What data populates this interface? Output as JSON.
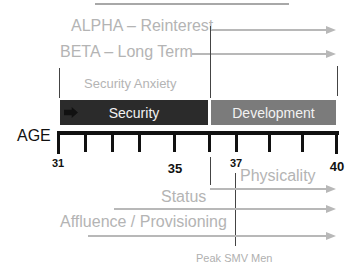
{
  "diagram": {
    "axis": {
      "label": "AGE",
      "ticks": [
        {
          "value": "31",
          "x": 58,
          "label_y": 157
        },
        {
          "value": "",
          "x": 85
        },
        {
          "value": "",
          "x": 112
        },
        {
          "value": "",
          "x": 139
        },
        {
          "value": "35",
          "x": 174,
          "label_y": 162
        },
        {
          "value": "",
          "x": 209
        },
        {
          "value": "37",
          "x": 236,
          "label_y": 157
        },
        {
          "value": "",
          "x": 269
        },
        {
          "value": "",
          "x": 302
        },
        {
          "value": "40",
          "x": 336,
          "label_y": 160
        }
      ]
    },
    "top_labels": {
      "alpha": "ALPHA – Reinterest",
      "beta": "BETA – Long Term",
      "security_anxiety": "Security Anxiety"
    },
    "phases": [
      {
        "label": "Security",
        "color": "#2b2b2b"
      },
      {
        "label": "Development",
        "color": "#7b7b7b"
      }
    ],
    "bottom_labels": {
      "physicality": "Physicality",
      "status": "Status",
      "affluence": "Affluence / Provisioning",
      "peak": "Peak SMV Men"
    },
    "colors": {
      "arrow": "#b8b8b8",
      "faded_text": "#b4b4b4",
      "axis": "#111111"
    }
  }
}
